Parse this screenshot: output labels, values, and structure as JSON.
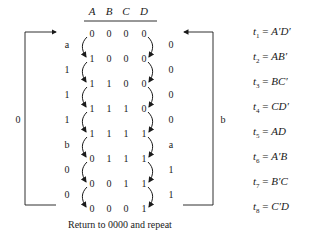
{
  "table": {
    "headers": [
      "A",
      "B",
      "C",
      "D"
    ],
    "rows": [
      [
        "0",
        "0",
        "0",
        "0"
      ],
      [
        "1",
        "0",
        "0",
        "0"
      ],
      [
        "1",
        "1",
        "0",
        "0"
      ],
      [
        "1",
        "1",
        "1",
        "0"
      ],
      [
        "1",
        "1",
        "1",
        "1"
      ],
      [
        "0",
        "1",
        "1",
        "1"
      ],
      [
        "0",
        "0",
        "1",
        "1"
      ],
      [
        "0",
        "0",
        "0",
        "1"
      ]
    ]
  },
  "left_transition_labels": [
    "a",
    "1",
    "1",
    "1",
    "b",
    "0",
    "0"
  ],
  "right_transition_labels": [
    "0",
    "0",
    "0",
    "0",
    "a",
    "1",
    "1"
  ],
  "left_bracket_label": "0",
  "right_bracket_label": "b",
  "equations": [
    {
      "term": "t",
      "sub": "1",
      "eq": "=",
      "expr": "A′D′"
    },
    {
      "term": "t",
      "sub": "2",
      "eq": "=",
      "expr": "AB′"
    },
    {
      "term": "t",
      "sub": "3",
      "eq": "=",
      "expr": "BC′"
    },
    {
      "term": "t",
      "sub": "4",
      "eq": "=",
      "expr": "CD′"
    },
    {
      "term": "t",
      "sub": "5",
      "eq": "=",
      "expr": "AD"
    },
    {
      "term": "t",
      "sub": "6",
      "eq": "=",
      "expr": "A′B"
    },
    {
      "term": "t",
      "sub": "7",
      "eq": "=",
      "expr": "B′C"
    },
    {
      "term": "t",
      "sub": "8",
      "eq": "=",
      "expr": "C′D"
    }
  ],
  "caption": "Return to 0000 and repeat"
}
